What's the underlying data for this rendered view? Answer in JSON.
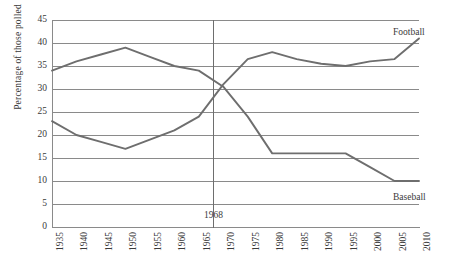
{
  "chart_data": {
    "type": "line",
    "title": "",
    "xlabel": "",
    "ylabel": "Percentage of those polled",
    "xlim": [
      1935,
      2010
    ],
    "ylim": [
      0,
      45
    ],
    "ytick_step": 5,
    "grid": true,
    "legend_position": "inline-right",
    "x": [
      1935,
      1940,
      1945,
      1950,
      1955,
      1960,
      1965,
      1970,
      1975,
      1980,
      1985,
      1990,
      1995,
      2000,
      2005,
      2010
    ],
    "yticks": [
      "0",
      "5",
      "10",
      "15",
      "20",
      "25",
      "30",
      "35",
      "40",
      "45"
    ],
    "xticks": [
      "1935",
      "1940",
      "1945",
      "1950",
      "1955",
      "1960",
      "1965",
      "1970",
      "1975",
      "1980",
      "1985",
      "1990",
      "1995",
      "2000",
      "2005",
      "2010"
    ],
    "series": [
      {
        "name": "Football",
        "color": "#6e6e6e",
        "values": [
          23,
          20,
          18.5,
          17,
          19,
          21,
          24,
          31,
          36.5,
          38,
          36.5,
          35.5,
          35,
          36,
          36.5,
          41
        ]
      },
      {
        "name": "Baseball",
        "color": "#6e6e6e",
        "values": [
          34,
          36,
          37.5,
          39,
          37,
          35,
          34,
          30.5,
          24,
          16,
          16,
          16,
          16,
          13,
          10,
          10
        ]
      }
    ],
    "annotations": [
      {
        "label": "1968",
        "x": 1968,
        "type": "vertical-line",
        "color": "#6e6e6e"
      }
    ]
  }
}
